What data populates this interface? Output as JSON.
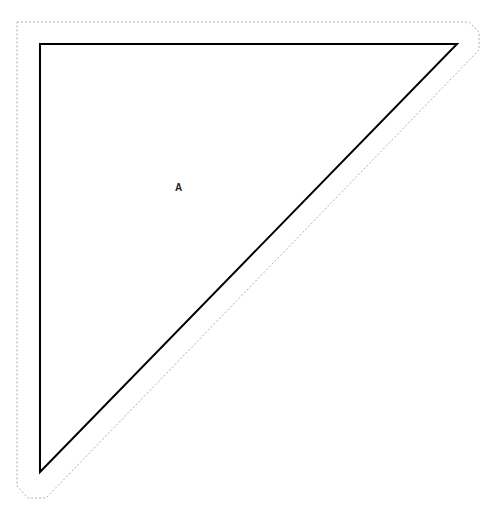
{
  "diagram": {
    "shape_label": "A",
    "colors": {
      "background": "#ffffff",
      "shape_stroke": "#000000",
      "outline_stroke": "#b0b0b0",
      "label": "#222222"
    }
  }
}
